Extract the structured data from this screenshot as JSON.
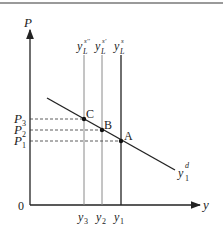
{
  "diagram": {
    "type": "supply-demand",
    "axes": {
      "y_label": "P",
      "x_label": "y",
      "origin_label": "0"
    },
    "supply_curves": [
      {
        "label_base": "y",
        "label_sub": "L",
        "label_sup": "s''",
        "x_label": "y",
        "x_label_sub": "3",
        "color": "#8a8a8a"
      },
      {
        "label_base": "y",
        "label_sub": "L",
        "label_sup": "s'",
        "x_label": "y",
        "x_label_sub": "2",
        "color": "#8a8a8a"
      },
      {
        "label_base": "y",
        "label_sub": "L",
        "label_sup": "s",
        "x_label": "y",
        "x_label_sub": "1",
        "color": "#222222"
      }
    ],
    "demand_curve": {
      "label_base": "y",
      "label_sub": "1",
      "label_sup": "d"
    },
    "points": [
      {
        "name": "C",
        "price_label": "P",
        "price_sub": "3"
      },
      {
        "name": "B",
        "price_label": "P",
        "price_sub": "2"
      },
      {
        "name": "A",
        "price_label": "P",
        "price_sub": "1"
      }
    ]
  }
}
